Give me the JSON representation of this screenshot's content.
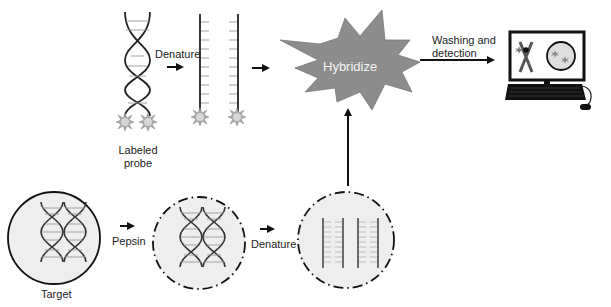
{
  "diagram": {
    "steps": {
      "probe_label": "Labeled\nprobe",
      "probe_label_line1": "Labeled",
      "probe_label_line2": "probe",
      "denature_probe": "Denature",
      "hybridize": "Hybridize",
      "washing_line1": "Washing and",
      "washing_line2": "detection",
      "target_label": "Target",
      "pepsin": "Pepsin",
      "denature_target": "Denature"
    },
    "colors": {
      "burst_fill": "#8c8c8c",
      "circle_fill": "#eeeeee",
      "line": "#222222",
      "rung": "#999999",
      "star": "#aaaaaa"
    }
  }
}
